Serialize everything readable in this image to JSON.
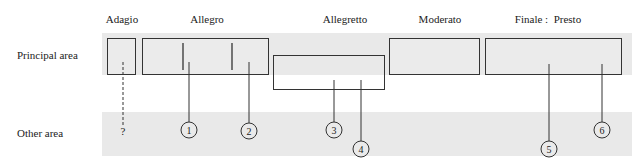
{
  "columns": [
    {
      "label": "Adagio",
      "x": 122
    },
    {
      "label": "Allegro",
      "x": 207
    },
    {
      "label": "Allegretto",
      "x": 345
    },
    {
      "label": "Moderato",
      "x": 440
    },
    {
      "label": "Finale :  Presto",
      "x": 545
    }
  ],
  "rows": [
    {
      "label": "Principal area",
      "y": 60
    },
    {
      "label": "Other area",
      "y": 138
    }
  ],
  "colors": {
    "band": "#e9e9e9",
    "box_fill": "#ebebeb",
    "line": "#333333"
  },
  "unknown_marker": "?",
  "markers": [
    {
      "num": "1",
      "cx": 189,
      "cy": 130
    },
    {
      "num": "2",
      "cx": 249,
      "cy": 131
    },
    {
      "num": "3",
      "cx": 334,
      "cy": 130
    },
    {
      "num": "4",
      "cx": 361,
      "cy": 149
    },
    {
      "num": "5",
      "cx": 549,
      "cy": 149
    },
    {
      "num": "6",
      "cx": 602,
      "cy": 130
    }
  ]
}
